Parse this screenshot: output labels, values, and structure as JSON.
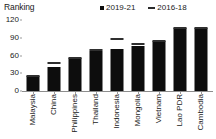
{
  "axis_title": "Ranking",
  "legend": [
    {
      "label": "2019-21",
      "marker": "filled-square-icon",
      "color": "#0d0d0d"
    },
    {
      "label": "2016-18",
      "marker": "dash-icon",
      "color": "#2f2f2f"
    }
  ],
  "chart_data": {
    "type": "bar",
    "title": "Ranking",
    "xlabel": "",
    "ylabel": "Ranking",
    "ylim": [
      0,
      120
    ],
    "yticks": [
      0,
      30,
      60,
      90,
      120
    ],
    "grid": false,
    "legend_position": "top-right",
    "categories": [
      "Malaysia",
      "China",
      "Philippines",
      "Thailand",
      "Indonesia",
      "Mongolia",
      "Vietnam",
      "Lao PDR",
      "Cambodia"
    ],
    "series": [
      {
        "name": "2019-21",
        "style": "bar",
        "values": [
          25,
          41,
          55,
          67,
          71,
          76,
          85,
          107,
          107
        ]
      },
      {
        "name": "2016-18",
        "style": "marker-dash",
        "values": [
          26,
          48,
          55,
          70,
          88,
          79,
          85,
          107,
          107
        ]
      }
    ]
  }
}
